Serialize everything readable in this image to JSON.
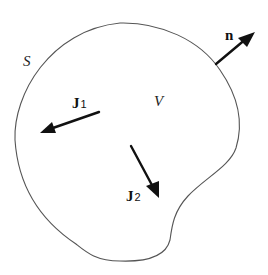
{
  "diagram": {
    "region": {
      "surface_label": "S",
      "volume_label": "V"
    },
    "vectors": [
      {
        "id": "n",
        "label": "n",
        "subscript": ""
      },
      {
        "id": "J1",
        "label": "J",
        "subscript": "1"
      },
      {
        "id": "J2",
        "label": "J",
        "subscript": "2"
      }
    ],
    "colors": {
      "outline": "#555555",
      "arrows": "#111111",
      "background": "#ffffff"
    }
  }
}
